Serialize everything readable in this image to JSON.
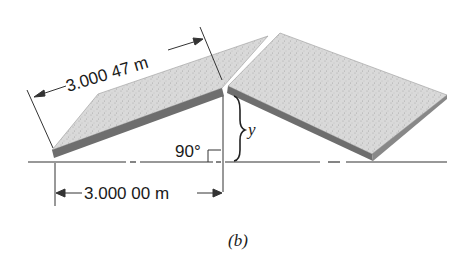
{
  "figure": {
    "caption": "(b)",
    "slant_length_label": "3.000 47 m",
    "horizontal_length_label": "3.000 00 m",
    "angle_label": "90°",
    "height_label": "y"
  },
  "colors": {
    "slab_top": "#d6d6d6",
    "slab_edge": "#6e6e6e",
    "line": "#333333"
  }
}
